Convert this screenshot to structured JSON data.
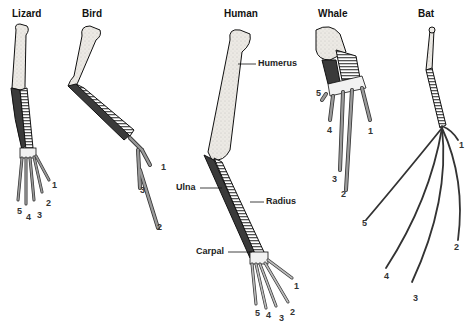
{
  "titles": {
    "lizard": "Lizard",
    "bird": "Bird",
    "human": "Human",
    "whale": "Whale",
    "bat": "Bat"
  },
  "labels": {
    "humerus": "Humerus",
    "ulna": "Ulna",
    "radius": "Radius",
    "carpal": "Carpal"
  },
  "digits": {
    "lizard": [
      "1",
      "2",
      "3",
      "4",
      "5"
    ],
    "bird": [
      "1",
      "2",
      "3"
    ],
    "human": [
      "1",
      "2",
      "3",
      "4",
      "5"
    ],
    "whale": [
      "1",
      "2",
      "3",
      "4",
      "5"
    ],
    "bat": [
      "1",
      "2",
      "3",
      "4",
      "5"
    ]
  },
  "colors": {
    "humerus": "#ece9e4",
    "ulna": "#3a3a3a",
    "radius_stripe": "#555555",
    "carpal": "#f2f2f2",
    "digits": "#9a9a9a",
    "outline": "#111111"
  }
}
